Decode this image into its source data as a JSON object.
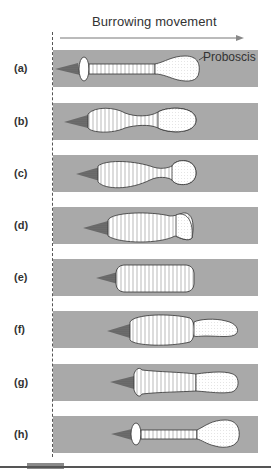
{
  "figure": {
    "title": "Burrowing movement",
    "annotation": "Proboscis",
    "colors": {
      "band": "#a9a9a9",
      "worm_fill": "#ffffff",
      "outline": "#333333",
      "tip": "#555555"
    },
    "panels": [
      {
        "label": "(a)",
        "top": 50
      },
      {
        "label": "(b)",
        "top": 103
      },
      {
        "label": "(c)",
        "top": 155
      },
      {
        "label": "(d)",
        "top": 207
      },
      {
        "label": "(e)",
        "top": 259
      },
      {
        "label": "(f)",
        "top": 311
      },
      {
        "label": "(g)",
        "top": 364
      },
      {
        "label": "(h)",
        "top": 416
      }
    ]
  }
}
